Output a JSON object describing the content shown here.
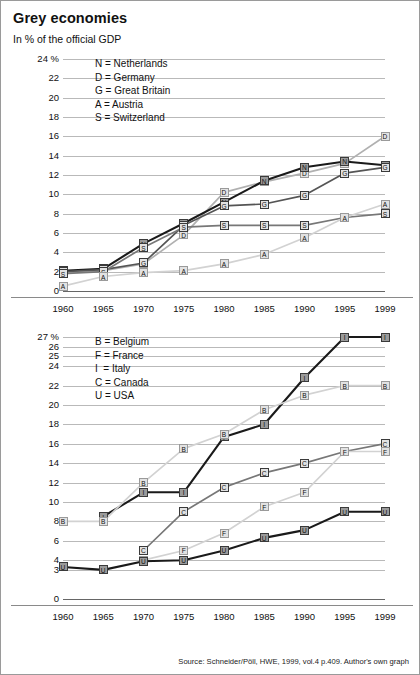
{
  "header": {
    "title": "Grey economies",
    "subtitle": "In % of the official GDP"
  },
  "source": "Source: Schneider/Pöll, HWE, 1999, vol.4 p.409. Author's own graph",
  "colors": {
    "black": "#1a1a1a",
    "dark_grey": "#555555",
    "mid_grey": "#777777",
    "light_grey": "#b0b0b0",
    "pale_grey": "#d2d2d2",
    "grid": "#b9b9b9",
    "marker_fill": "#dcdcdc"
  },
  "chart_data": [
    {
      "type": "line",
      "id": "upper-chart",
      "title": "Grey economies",
      "subtitle": "In % of the official GDP",
      "xlabel": "",
      "ylabel": "24 %",
      "ylim": [
        0,
        24
      ],
      "ytick_step": 2,
      "grid": true,
      "legend_position": "top-left",
      "x": [
        "1960",
        "1965",
        "1970",
        "1975",
        "1980",
        "1985",
        "1990",
        "1995",
        "1999"
      ],
      "yticks": [
        "24 %",
        "22",
        "20",
        "18",
        "16",
        "14",
        "12",
        "10",
        "8",
        "6",
        "4",
        "2",
        "0"
      ],
      "legend": [
        "N = Netherlands",
        "D = Germany",
        "G = Great Britain",
        "A = Austria",
        "S = Switzerland"
      ],
      "series": [
        {
          "name": "D",
          "label": "Germany",
          "color": "#b0b0b0",
          "values": [
            1.9,
            2.1,
            2.8,
            5.8,
            10.2,
            11.3,
            12.2,
            13.2,
            16.0
          ]
        },
        {
          "name": "N",
          "label": "Netherlands",
          "color": "#1a1a1a",
          "values": [
            2.1,
            2.3,
            4.9,
            7.0,
            9.2,
            11.4,
            12.8,
            13.4,
            13.0
          ]
        },
        {
          "name": "G",
          "label": "Great Britain",
          "color": "#555555",
          "values": [
            2.0,
            2.2,
            2.9,
            6.8,
            8.8,
            9.0,
            9.9,
            12.2,
            12.8
          ]
        },
        {
          "name": "S",
          "label": "Switzerland",
          "color": "#777777",
          "values": [
            1.8,
            2.0,
            4.5,
            6.6,
            6.8,
            6.8,
            6.8,
            7.6,
            8.0
          ]
        },
        {
          "name": "A",
          "label": "Austria",
          "color": "#d2d2d2",
          "values": [
            0.5,
            1.5,
            1.9,
            2.1,
            2.8,
            3.8,
            5.5,
            7.6,
            9.0
          ]
        }
      ]
    },
    {
      "type": "line",
      "id": "lower-chart",
      "xlabel": "",
      "ylabel": "27 %",
      "ylim": [
        0,
        27
      ],
      "grid": true,
      "legend_position": "top-left",
      "x": [
        "1960",
        "1965",
        "1970",
        "1975",
        "1980",
        "1985",
        "1990",
        "1995",
        "1999"
      ],
      "yticks": [
        "27 %",
        "26",
        "25",
        "24",
        "22",
        "20",
        "18",
        "16",
        "14",
        "12",
        "10",
        "8",
        "6",
        "4",
        "3",
        "0"
      ],
      "legend": [
        "B = Belgium",
        "F = France",
        "I  = Italy",
        "C = Canada",
        "U = USA"
      ],
      "series": [
        {
          "name": "I",
          "label": "Italy",
          "color": "#1a1a1a",
          "values": [
            null,
            8.5,
            11.0,
            11.0,
            16.7,
            18.0,
            22.8,
            27.0,
            27.0
          ]
        },
        {
          "name": "B",
          "label": "Belgium",
          "color": "#d2d2d2",
          "values": [
            8.0,
            8.0,
            12.0,
            15.5,
            17.0,
            19.5,
            21.0,
            22.0,
            22.0
          ]
        },
        {
          "name": "C",
          "label": "Canada",
          "color": "#777777",
          "values": [
            null,
            null,
            5.0,
            9.0,
            11.5,
            13.0,
            14.0,
            15.2,
            16.0
          ]
        },
        {
          "name": "F",
          "label": "France",
          "color": "#d2d2d2",
          "values": [
            null,
            null,
            4.0,
            5.0,
            6.8,
            9.5,
            11.0,
            15.2,
            15.2
          ]
        },
        {
          "name": "U",
          "label": "USA",
          "color": "#1a1a1a",
          "values": [
            3.3,
            3.0,
            3.9,
            4.0,
            5.0,
            6.3,
            7.1,
            9.0,
            9.0
          ]
        }
      ]
    }
  ]
}
